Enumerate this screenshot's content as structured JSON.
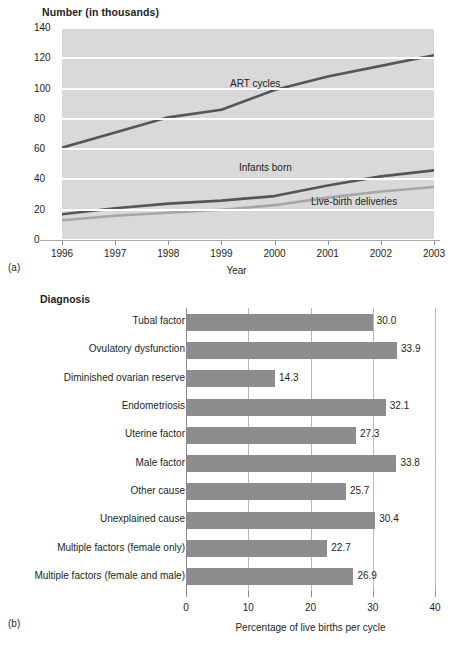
{
  "figure": {
    "panel_a_tag": "(a)",
    "panel_b_tag": "(b)"
  },
  "chart_data": [
    {
      "id": "panel_a",
      "type": "line",
      "title": "",
      "ylabel": "Number (in thousands)",
      "xlabel": "Year",
      "grid": true,
      "legend": "inline-annotations",
      "x": [
        "1996",
        "1997",
        "1998",
        "1999",
        "2000",
        "2001",
        "2002",
        "2003"
      ],
      "xlim": [
        1996,
        2003
      ],
      "ylim": [
        0,
        140
      ],
      "yticks": [
        "140",
        "120",
        "100",
        "80",
        "60",
        "40",
        "20",
        "0"
      ],
      "ytick_values": [
        140,
        120,
        100,
        80,
        60,
        40,
        20,
        0
      ],
      "series": [
        {
          "name": "ART cycles",
          "values": [
            61,
            71,
            81,
            86,
            99,
            108,
            115,
            122
          ],
          "color": "#56565a"
        },
        {
          "name": "Infants born",
          "values": [
            17,
            21,
            24,
            26,
            29,
            36,
            42,
            46
          ],
          "color": "#56565a"
        },
        {
          "name": "Live-birth deliveries",
          "values": [
            13,
            16,
            18,
            20,
            23,
            28,
            32,
            35
          ],
          "color": "#a6a6a6"
        }
      ],
      "annotations": [
        {
          "text": "ART cycles"
        },
        {
          "text": "Infants born"
        },
        {
          "text": "Live-birth deliveries"
        }
      ],
      "plot_bg": "#d9d9d9",
      "gridline_color": "#ffffff"
    },
    {
      "id": "panel_b",
      "type": "bar",
      "orientation": "horizontal",
      "title": "",
      "ylabel": "Diagnosis",
      "xlabel": "Percentage of live births per cycle",
      "grid": true,
      "xlim": [
        0,
        40
      ],
      "xticks": [
        "0",
        "10",
        "20",
        "30",
        "40"
      ],
      "xtick_values": [
        0,
        10,
        20,
        30,
        40
      ],
      "bar_color": "#8d8d8d",
      "categories": [
        "Tubal factor",
        "Ovulatory dysfunction",
        "Diminished ovarian reserve",
        "Endometriosis",
        "Uterine factor",
        "Male factor",
        "Other cause",
        "Unexplained cause",
        "Multiple factors (female only)",
        "Multiple factors (female and male)"
      ],
      "values": [
        30.0,
        33.9,
        14.3,
        32.1,
        27.3,
        33.8,
        25.7,
        30.4,
        22.7,
        26.9
      ],
      "value_labels": [
        "30.0",
        "33.9",
        "14.3",
        "32.1",
        "27.3",
        "33.8",
        "25.7",
        "30.4",
        "22.7",
        "26.9"
      ]
    }
  ]
}
